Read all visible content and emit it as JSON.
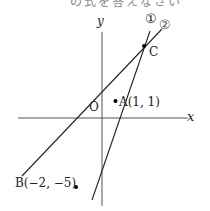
{
  "figure": {
    "top_cut_text": "の式を答えなさい",
    "axes": {
      "x_label": "x",
      "y_label": "y",
      "origin_label": "O"
    },
    "lines": [
      {
        "label": "①"
      },
      {
        "label": "②"
      }
    ],
    "points": {
      "A": {
        "label": "A(1, 1)",
        "x": 1,
        "y": 1
      },
      "B": {
        "label": "B(−2, −5)",
        "x": -2,
        "y": -5
      },
      "C": {
        "label": "C"
      }
    }
  }
}
